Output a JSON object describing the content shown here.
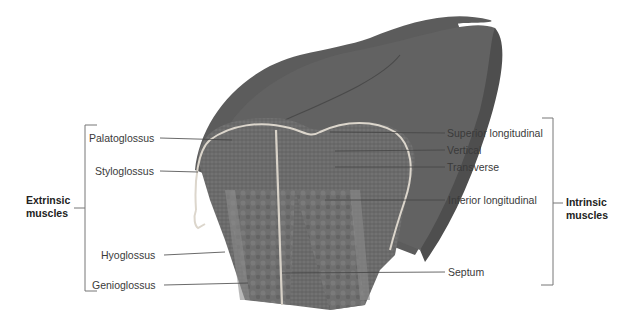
{
  "diagram": {
    "colors": {
      "tongue_surface": "#5f5f5f",
      "muscle_mass": "#6e6e6e",
      "mucosa_line": "#d9d4cc",
      "leader_line": "#444444",
      "bracket": "#777777"
    },
    "left_group": {
      "title_line1": "Extrinsic",
      "title_line2": "muscles",
      "labels": [
        {
          "text": "Palatoglossus"
        },
        {
          "text": "Styloglossus"
        },
        {
          "text": "Hyoglossus"
        },
        {
          "text": "Genioglossus"
        }
      ]
    },
    "right_group": {
      "title_line1": "Intrinsic",
      "title_line2": "muscles",
      "labels": [
        {
          "text": "Superior longitudinal"
        },
        {
          "text": "Vertical"
        },
        {
          "text": "Transverse"
        },
        {
          "text": "Inferior longitudinal"
        },
        {
          "text": "Septum"
        }
      ]
    }
  }
}
